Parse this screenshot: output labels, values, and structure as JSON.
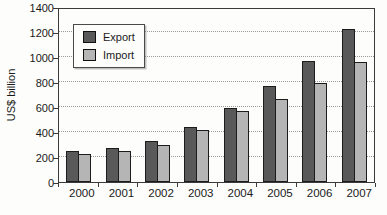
{
  "chart_data": {
    "type": "bar",
    "title": "",
    "xlabel": "",
    "ylabel": "US$ billion",
    "categories": [
      "2000",
      "2001",
      "2002",
      "2003",
      "2004",
      "2005",
      "2006",
      "2007"
    ],
    "series": [
      {
        "name": "Export",
        "color": "#595959",
        "values": [
          250,
          268,
          330,
          440,
          595,
          765,
          970,
          1220
        ]
      },
      {
        "name": "Import",
        "color": "#b5b5b5",
        "values": [
          227,
          245,
          297,
          415,
          565,
          662,
          792,
          958
        ]
      }
    ],
    "ylim": [
      0,
      1400
    ],
    "yticks": [
      0,
      200,
      400,
      600,
      800,
      1000,
      1200,
      1400
    ],
    "grid": "horizontal-dotted",
    "legend_position": "top-left-inside",
    "bar_outline_color": "#1c1c1c",
    "frame_color": "#3a3a3a"
  }
}
